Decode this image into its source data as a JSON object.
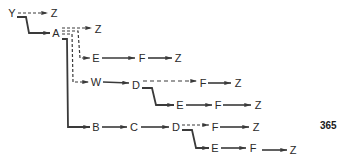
{
  "diagram": {
    "type": "tree-derivation",
    "colors": {
      "line": "#3a3a3a",
      "text": "#2a2a2a"
    },
    "nodes": [
      {
        "id": "n_y",
        "label": "Y",
        "x": 12,
        "y": 13
      },
      {
        "id": "n_z1",
        "label": "Z",
        "x": 54,
        "y": 13
      },
      {
        "id": "n_a",
        "label": "A",
        "x": 56,
        "y": 33
      },
      {
        "id": "n_z2",
        "label": "Z",
        "x": 98,
        "y": 29
      },
      {
        "id": "n_e1",
        "label": "E",
        "x": 96,
        "y": 58
      },
      {
        "id": "n_f1",
        "label": "F",
        "x": 142,
        "y": 58
      },
      {
        "id": "n_z3",
        "label": "Z",
        "x": 178,
        "y": 58
      },
      {
        "id": "n_w",
        "label": "W",
        "x": 96,
        "y": 82
      },
      {
        "id": "n_d1",
        "label": "D",
        "x": 136,
        "y": 85
      },
      {
        "id": "n_f2",
        "label": "F",
        "x": 203,
        "y": 83
      },
      {
        "id": "n_z4",
        "label": "Z",
        "x": 238,
        "y": 83
      },
      {
        "id": "n_e2",
        "label": "E",
        "x": 180,
        "y": 105
      },
      {
        "id": "n_f3",
        "label": "F",
        "x": 218,
        "y": 105
      },
      {
        "id": "n_z5",
        "label": "Z",
        "x": 258,
        "y": 105
      },
      {
        "id": "n_b",
        "label": "B",
        "x": 96,
        "y": 127
      },
      {
        "id": "n_c",
        "label": "C",
        "x": 134,
        "y": 127
      },
      {
        "id": "n_d2",
        "label": "D",
        "x": 176,
        "y": 127
      },
      {
        "id": "n_f4",
        "label": "F",
        "x": 215,
        "y": 127
      },
      {
        "id": "n_z6",
        "label": "Z",
        "x": 256,
        "y": 127
      },
      {
        "id": "n_e3",
        "label": "E",
        "x": 215,
        "y": 148
      },
      {
        "id": "n_f5",
        "label": "F",
        "x": 253,
        "y": 148
      },
      {
        "id": "n_z7",
        "label": "Z",
        "x": 293,
        "y": 150
      }
    ],
    "edges": [
      {
        "from": "Y",
        "to": "Z",
        "style": "dashed"
      },
      {
        "from": "Y",
        "to": "A",
        "style": "solid"
      },
      {
        "from": "A",
        "to": "Z",
        "style": "dashed"
      },
      {
        "from": "A",
        "to": "E",
        "style": "dashed"
      },
      {
        "from": "E",
        "to": "F",
        "style": "solid"
      },
      {
        "from": "F",
        "to": "Z",
        "style": "solid"
      },
      {
        "from": "A",
        "to": "W",
        "style": "dashed"
      },
      {
        "from": "W",
        "to": "D",
        "style": "solid"
      },
      {
        "from": "D",
        "to": "F",
        "style": "dashed"
      },
      {
        "from": "F",
        "to": "Z",
        "style": "solid"
      },
      {
        "from": "D",
        "to": "E",
        "style": "solid"
      },
      {
        "from": "E",
        "to": "F",
        "style": "solid"
      },
      {
        "from": "F",
        "to": "Z",
        "style": "solid"
      },
      {
        "from": "A",
        "to": "B",
        "style": "solid"
      },
      {
        "from": "B",
        "to": "C",
        "style": "solid"
      },
      {
        "from": "C",
        "to": "D",
        "style": "solid"
      },
      {
        "from": "D",
        "to": "F",
        "style": "dashed"
      },
      {
        "from": "F",
        "to": "Z",
        "style": "solid"
      },
      {
        "from": "D",
        "to": "E",
        "style": "solid"
      },
      {
        "from": "E",
        "to": "F",
        "style": "solid"
      },
      {
        "from": "F",
        "to": "Z",
        "style": "solid"
      }
    ]
  },
  "page_number": "365"
}
